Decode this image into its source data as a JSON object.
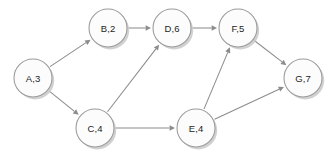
{
  "diagram": {
    "type": "directed-graph",
    "title": "",
    "background_color": "#ffffff",
    "node_fill_color": "#fcfcfc",
    "node_stroke_color": "#9a9a9a",
    "node_shadow_color": "#c9c9c9",
    "edge_color": "#8c8c8c",
    "label_color": "#1d1d1d",
    "node_radius": 19,
    "nodes": [
      {
        "id": "A",
        "label": "A,3",
        "name": "A",
        "value": "3",
        "cx": 33,
        "cy": 78
      },
      {
        "id": "B",
        "label": "B,2",
        "name": "B",
        "value": "2",
        "cx": 108,
        "cy": 28
      },
      {
        "id": "D",
        "label": "D,6",
        "name": "D",
        "value": "6",
        "cx": 172,
        "cy": 28
      },
      {
        "id": "F",
        "label": "F,5",
        "name": "F",
        "value": "5",
        "cx": 238,
        "cy": 28
      },
      {
        "id": "G",
        "label": "G,7",
        "name": "G",
        "value": "7",
        "cx": 303,
        "cy": 78
      },
      {
        "id": "C",
        "label": "C,4",
        "name": "C",
        "value": "4",
        "cx": 95,
        "cy": 128
      },
      {
        "id": "E",
        "label": "E,4",
        "name": "E",
        "value": "4",
        "cx": 196,
        "cy": 128
      }
    ],
    "edges": [
      {
        "id": "A-B",
        "from": "A",
        "to": "B",
        "directed": true,
        "label": ""
      },
      {
        "id": "A-C",
        "from": "A",
        "to": "C",
        "directed": true,
        "label": ""
      },
      {
        "id": "B-D",
        "from": "B",
        "to": "D",
        "directed": true,
        "label": ""
      },
      {
        "id": "D-F",
        "from": "D",
        "to": "F",
        "directed": true,
        "label": ""
      },
      {
        "id": "C-D",
        "from": "C",
        "to": "D",
        "directed": true,
        "label": ""
      },
      {
        "id": "C-E",
        "from": "C",
        "to": "E",
        "directed": true,
        "label": ""
      },
      {
        "id": "E-F",
        "from": "E",
        "to": "F",
        "directed": true,
        "label": ""
      },
      {
        "id": "E-G",
        "from": "E",
        "to": "G",
        "directed": true,
        "label": ""
      },
      {
        "id": "F-G",
        "from": "F",
        "to": "G",
        "directed": true,
        "label": ""
      }
    ]
  }
}
